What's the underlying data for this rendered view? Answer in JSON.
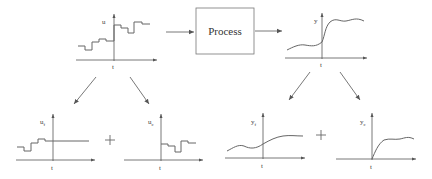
{
  "process_block": {
    "label": "Process"
  },
  "plots": {
    "input": {
      "ylabel": "u",
      "xlabel": "t",
      "kind": "step"
    },
    "output": {
      "ylabel": "y",
      "xlabel": "t",
      "kind": "smooth"
    },
    "input_free": {
      "ylabel": "u",
      "ylabel_sub": "f",
      "xlabel": "t",
      "kind": "step"
    },
    "input_forced": {
      "ylabel": "u",
      "ylabel_sub": "c",
      "xlabel": "t",
      "kind": "step"
    },
    "output_free": {
      "ylabel": "y",
      "ylabel_sub": "f",
      "xlabel": "t",
      "kind": "smooth"
    },
    "output_forced": {
      "ylabel": "y",
      "ylabel_sub": "c",
      "xlabel": "t",
      "kind": "smooth"
    }
  },
  "operators": {
    "plus_left": "+",
    "plus_right": "+"
  },
  "colors": {
    "line": "#666666",
    "axis": "#555555",
    "text": "#333333"
  }
}
